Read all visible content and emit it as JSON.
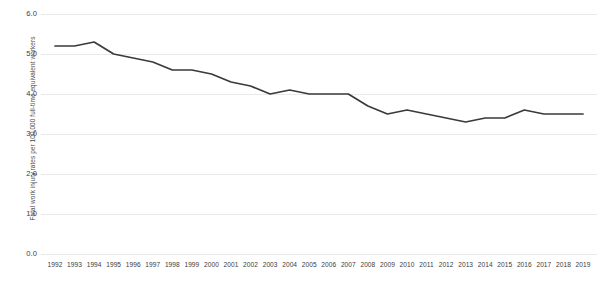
{
  "chart_data": {
    "type": "line",
    "title": "",
    "subtitle": "",
    "xlabel": "",
    "ylabel": "Fatal work injury rates per 100,000 full-time equivalent workers",
    "categories": [
      "1992",
      "1993",
      "1994",
      "1995",
      "1996",
      "1997",
      "1998",
      "1999",
      "2000",
      "2001",
      "2002",
      "2003",
      "2004",
      "2005",
      "2006",
      "2007",
      "2008",
      "2009",
      "2010",
      "2011",
      "2012",
      "2013",
      "2014",
      "2015",
      "2016",
      "2017",
      "2018",
      "2019"
    ],
    "values": [
      5.2,
      5.2,
      5.3,
      5.0,
      4.9,
      4.8,
      4.6,
      4.6,
      4.5,
      4.3,
      4.2,
      4.0,
      4.1,
      4.0,
      4.0,
      4.0,
      3.7,
      3.5,
      3.6,
      3.5,
      3.4,
      3.3,
      3.4,
      3.4,
      3.6,
      3.5,
      3.5,
      3.5
    ],
    "series": [
      {
        "name": "Fatal work injury rate",
        "values": [
          5.2,
          5.2,
          5.3,
          5.0,
          4.9,
          4.8,
          4.6,
          4.6,
          4.5,
          4.3,
          4.2,
          4.0,
          4.1,
          4.0,
          4.0,
          4.0,
          3.7,
          3.5,
          3.6,
          3.5,
          3.4,
          3.3,
          3.4,
          3.4,
          3.6,
          3.5,
          3.5,
          3.5
        ],
        "color": "#3a3a3a"
      }
    ],
    "ylim": [
      0.0,
      6.0
    ],
    "ytick_labels": [
      "6.0",
      "5.0",
      "4.0",
      "3.0",
      "2.0",
      "1.0",
      "0.0"
    ],
    "ytick_values": [
      6.0,
      5.0,
      4.0,
      3.0,
      2.0,
      1.0,
      0.0
    ],
    "grid": true,
    "grid_color": "#e9e9e9",
    "legend": "none",
    "legend_position": "none",
    "line_color": "#3a3a3a",
    "background_color": "#ffffff",
    "annotations": []
  },
  "watermark": {
    "line1": "",
    "line2": ""
  }
}
